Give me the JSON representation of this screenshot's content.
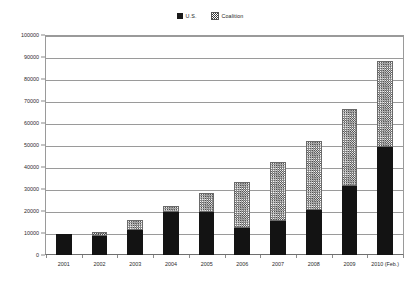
{
  "chart_data": {
    "type": "bar",
    "title": "",
    "subtitle": "",
    "xlabel": "",
    "ylabel": "",
    "stacked": true,
    "grid": true,
    "legend_position": "top-center",
    "ylim": [
      0,
      100000
    ],
    "ytick_step": 10000,
    "yticks": [
      "0",
      "10000",
      "20000",
      "30000",
      "40000",
      "50000",
      "60000",
      "70000",
      "80000",
      "90000",
      "100000"
    ],
    "categories": [
      "2001",
      "2002",
      "2003",
      "2004",
      "2005",
      "2006",
      "2007",
      "2008",
      "2009",
      "2010 (Feb.)"
    ],
    "series": [
      {
        "name": "U.S.",
        "color": "#131313",
        "pattern": "solid",
        "values": [
          9700,
          8500,
          11500,
          19500,
          19500,
          12500,
          15500,
          20500,
          31500,
          49000
        ]
      },
      {
        "name": "Coalition",
        "color": "#4a4a4a",
        "pattern": "checker",
        "values": [
          0,
          1900,
          4400,
          2800,
          8900,
          20700,
          27000,
          31200,
          34700,
          39000
        ]
      }
    ],
    "totals": [
      9700,
      10400,
      15900,
      22300,
      28400,
      33200,
      42500,
      51700,
      66200,
      88000
    ]
  },
  "legend": {
    "items": [
      {
        "label": "U.S."
      },
      {
        "label": "Coalition"
      }
    ]
  },
  "caption": ""
}
